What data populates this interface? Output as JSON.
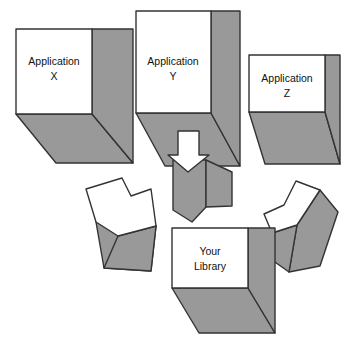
{
  "diagram": {
    "type": "isometric-block-diagram",
    "background_color": "#ffffff",
    "palette": {
      "face_white": "#ffffff",
      "face_gray": "#999999",
      "stroke": "#333333",
      "text": "#111111"
    },
    "nodes": [
      {
        "id": "application-x",
        "name": "Application X",
        "label_line1": "Application",
        "label_line2": "X",
        "shape": "cube",
        "face_color": "#ffffff",
        "side_color": "#999999"
      },
      {
        "id": "application-y",
        "name": "Application Y",
        "label_line1": "Application",
        "label_line2": "Y",
        "shape": "cube",
        "face_color": "#ffffff",
        "side_color": "#999999"
      },
      {
        "id": "application-z",
        "name": "Application Z",
        "label_line1": "Application",
        "label_line2": "Z",
        "shape": "cube",
        "face_color": "#ffffff",
        "side_color": "#999999"
      },
      {
        "id": "your-library",
        "name": "Your Library",
        "label_line1": "Your",
        "label_line2": "Library",
        "shape": "cube",
        "face_color": "#ffffff",
        "side_color": "#999999"
      }
    ],
    "connectors": [
      {
        "id": "arrow-x-to-library",
        "from": "application-x",
        "to": "your-library",
        "direction": "down-right",
        "style": "3d-extruded-arrow",
        "top_face_color": "#ffffff",
        "side_color": "#999999"
      },
      {
        "id": "arrow-y-to-library",
        "from": "application-y",
        "to": "your-library",
        "direction": "down",
        "style": "3d-extruded-arrow-with-overlay",
        "top_face_color": "#ffffff",
        "side_color": "#999999"
      },
      {
        "id": "arrow-z-to-library",
        "from": "application-z",
        "to": "your-library",
        "direction": "down-left",
        "style": "3d-extruded-arrow",
        "top_face_color": "#ffffff",
        "side_color": "#999999"
      }
    ]
  }
}
